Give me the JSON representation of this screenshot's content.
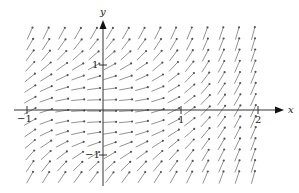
{
  "figure": {
    "type": "direction-field",
    "equation": "dy/dx = x^2 + y^2",
    "x_axis_label": "x",
    "y_axis_label": "y",
    "x_ticks": [
      {
        "value": -1,
        "label": "−1"
      },
      {
        "value": 1,
        "label": "1"
      },
      {
        "value": 2,
        "label": "2"
      }
    ],
    "y_ticks": [
      {
        "value": 1,
        "label": "1"
      },
      {
        "value": -1,
        "label": "−1"
      }
    ],
    "colors": {
      "axis": "#333333",
      "arrow": "#777777"
    }
  },
  "chart_data": {
    "type": "direction-field",
    "title": "",
    "xlabel": "x",
    "ylabel": "y",
    "xlim": [
      -1.1,
      2.3
    ],
    "ylim": [
      -1.7,
      1.9
    ],
    "x_tick_labels": [
      "−1",
      "1",
      "2"
    ],
    "y_tick_labels": [
      "1",
      "−1"
    ],
    "slope_function": "x^2 + y^2",
    "grid_x_range": [
      -0.95,
      1.95
    ],
    "grid_y_range": [
      -1.5,
      1.7
    ],
    "grid_cols": 15,
    "grid_rows": 14
  }
}
